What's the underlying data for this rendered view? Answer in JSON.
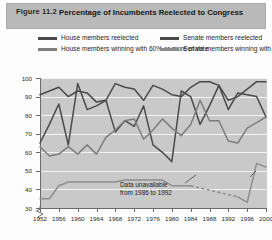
{
  "figure": {
    "number": "Figure 11.2",
    "title": "Percentage of Incumbents Reelected to Congress"
  },
  "legend": {
    "position": "top",
    "items": [
      {
        "label": "House members reelected",
        "color": "#4a4a4a"
      },
      {
        "label": "House members winning with 60% or more of vote",
        "color": "#7d7d7d"
      },
      {
        "label": "Senate members reelected",
        "color": "#4a4a4a"
      },
      {
        "label": "Senate members winning with 60% or more of vote",
        "color": "#8d8d8d"
      }
    ]
  },
  "annotation": {
    "line1": "Data unavailable",
    "line2": "from 1986 to 1992"
  },
  "chart_data": {
    "type": "line",
    "title": "Percentage of Incumbents Reelected to Congress",
    "xlabel": "",
    "ylabel": "Percentage",
    "ylim": [
      30,
      100
    ],
    "ytick_values": [
      30,
      40,
      50,
      60,
      70,
      80,
      90,
      100
    ],
    "xlim": [
      1952,
      2000
    ],
    "xtick_values": [
      1952,
      1956,
      1960,
      1964,
      1968,
      1972,
      1976,
      1980,
      1984,
      1988,
      1992,
      1996,
      2000
    ],
    "grid": true,
    "axis_break_y": true,
    "x": [
      1952,
      1954,
      1956,
      1958,
      1960,
      1962,
      1964,
      1966,
      1968,
      1970,
      1972,
      1974,
      1976,
      1978,
      1980,
      1982,
      1984,
      1986,
      1988,
      1990,
      1992,
      1994,
      1996,
      1998,
      2000
    ],
    "series": [
      {
        "name": "House members reelected",
        "color": "#4a4a4a",
        "values": [
          91,
          93,
          95,
          90,
          93,
          92,
          87,
          88,
          97,
          95,
          94,
          88,
          96,
          94,
          91,
          90,
          95,
          98,
          98,
          96,
          88,
          90,
          94,
          98,
          98
        ]
      },
      {
        "name": "Senate members reelected",
        "color": "#4a4a4a",
        "values": [
          65,
          75,
          86,
          64,
          97,
          83,
          85,
          88,
          71,
          77,
          74,
          85,
          64,
          60,
          55,
          93,
          90,
          75,
          85,
          96,
          83,
          92,
          91,
          90,
          79
        ]
      },
      {
        "name": "House members winning with 60% or more of vote",
        "color": "#7d7d7d",
        "values": [
          63,
          58,
          59,
          63,
          59,
          64,
          59,
          68,
          72,
          77,
          78,
          67,
          72,
          78,
          73,
          69,
          75,
          88,
          77,
          77,
          66,
          65,
          73,
          76,
          79
        ]
      },
      {
        "name": "Senate members winning with 60% or more of vote",
        "color": "#8d8d8d",
        "values": [
          35,
          35,
          42,
          44,
          44,
          44,
          44,
          44,
          44,
          45,
          45,
          45,
          45,
          45,
          42,
          42,
          42,
          null,
          null,
          null,
          null,
          36,
          33,
          54,
          52
        ],
        "gap_note": "Data unavailable from 1986 to 1992",
        "gap_style": "dashed"
      }
    ]
  }
}
